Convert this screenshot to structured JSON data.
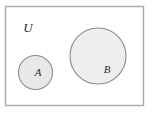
{
  "diagram": {
    "type": "euler-diagram",
    "canvas": {
      "width": 152,
      "height": 116,
      "background_color": "#ffffff"
    },
    "universe": {
      "label": "U",
      "label_x": 28,
      "label_y": 29,
      "label_font_size": 13,
      "rect": {
        "x": 5.5,
        "y": 6.5,
        "width": 138,
        "height": 99
      },
      "fill_color": "#ffffff",
      "stroke_color": "#a9a9a9",
      "stroke_width": 1.4
    },
    "sets": [
      {
        "label": "A",
        "shape": "circle",
        "cx": 35.5,
        "cy": 72.5,
        "r": 17,
        "label_x": 38,
        "label_y": 73,
        "label_font_size": 11,
        "fill_color": "#e9e8e8",
        "stroke_color": "#8a8a8a",
        "stroke_width": 1.1
      },
      {
        "label": "B",
        "shape": "circle",
        "cx": 98,
        "cy": 56,
        "r": 28,
        "label_x": 107,
        "label_y": 70,
        "label_font_size": 11,
        "fill_color": "#eeeeee",
        "stroke_color": "#8a8a8a",
        "stroke_width": 1.1
      }
    ],
    "relations": {
      "a_in_u": true,
      "b_in_u": true,
      "a_intersect_b": "empty"
    }
  }
}
